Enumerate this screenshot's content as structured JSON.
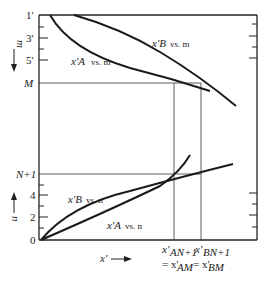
{
  "figure": {
    "upper_axis": {
      "label": "m",
      "direction": "down",
      "ticks": [
        "1'",
        "3'",
        "5'",
        "M"
      ]
    },
    "lower_axis": {
      "label": "n",
      "direction": "up",
      "ticks": [
        "N+1",
        "4",
        "2",
        "0"
      ]
    },
    "x_axis": {
      "label": "x'",
      "direction": "right"
    },
    "curves": [
      {
        "id": "xa_vs_m",
        "label_var": "x'A",
        "label_text": "vs. m"
      },
      {
        "id": "xb_vs_m",
        "label_var": "x'B",
        "label_text": "vs. m"
      },
      {
        "id": "xb_vs_n",
        "label_var": "x'B",
        "label_text": "vs. n"
      },
      {
        "id": "xa_vs_n",
        "label_var": "x'A",
        "label_text": "vs. n"
      }
    ],
    "bottom_labels": {
      "left_line1_var": "x'",
      "left_line1_sub": "AN+1",
      "left_line2": "= x'",
      "left_line2_sub": "AM",
      "right_line1_var": "x'",
      "right_line1_sub": "BN+1",
      "right_line2": "= x'",
      "right_line2_sub": "BM"
    }
  }
}
